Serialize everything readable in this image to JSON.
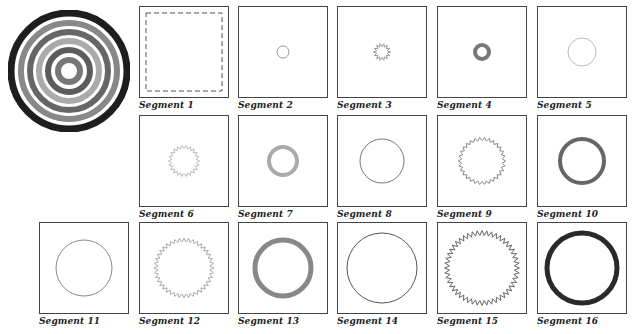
{
  "target": {
    "rings": [
      {
        "r": 58,
        "color": "#1e1e1e",
        "width": 7
      },
      {
        "r": 48,
        "color": "#888888",
        "width": 6
      },
      {
        "r": 39,
        "color": "#666666",
        "width": 6
      },
      {
        "r": 30,
        "color": "#aaaaaa",
        "width": 6
      },
      {
        "r": 21,
        "color": "#5c5c5c",
        "width": 6
      },
      {
        "r": 11,
        "color": "#777777",
        "width": 6
      }
    ]
  },
  "segments": [
    {
      "label": "Segment 1",
      "shape": "dashed-square",
      "r": 0,
      "color": "#555555",
      "width": 1
    },
    {
      "label": "Segment 2",
      "shape": "circle",
      "r": 6,
      "color": "#999999",
      "width": 1
    },
    {
      "label": "Segment 3",
      "shape": "zigzag",
      "r": 7,
      "color": "#999999",
      "width": 1,
      "teeth": 14
    },
    {
      "label": "Segment 4",
      "shape": "circle",
      "r": 7,
      "color": "#777777",
      "width": 4
    },
    {
      "label": "Segment 5",
      "shape": "circle",
      "r": 14,
      "color": "#bbbbbb",
      "width": 1
    },
    {
      "label": "Segment 6",
      "shape": "zigzag",
      "r": 14,
      "color": "#bbbbbb",
      "width": 1,
      "teeth": 22
    },
    {
      "label": "Segment 7",
      "shape": "circle",
      "r": 14,
      "color": "#aaaaaa",
      "width": 4
    },
    {
      "label": "Segment 8",
      "shape": "circle",
      "r": 22,
      "color": "#777777",
      "width": 1
    },
    {
      "label": "Segment 9",
      "shape": "zigzag",
      "r": 22,
      "color": "#888888",
      "width": 1,
      "teeth": 30
    },
    {
      "label": "Segment 10",
      "shape": "circle",
      "r": 22,
      "color": "#666666",
      "width": 4
    },
    {
      "label": "Segment 11",
      "shape": "circle",
      "r": 28,
      "color": "#888888",
      "width": 1
    },
    {
      "label": "Segment 12",
      "shape": "zigzag",
      "r": 28,
      "color": "#aaaaaa",
      "width": 1,
      "teeth": 40
    },
    {
      "label": "Segment 13",
      "shape": "circle",
      "r": 28,
      "color": "#888888",
      "width": 5
    },
    {
      "label": "Segment 14",
      "shape": "circle",
      "r": 35,
      "color": "#555555",
      "width": 1
    },
    {
      "label": "Segment 15",
      "shape": "zigzag",
      "r": 35,
      "color": "#666666",
      "width": 1,
      "teeth": 48
    },
    {
      "label": "Segment 16",
      "shape": "circle",
      "r": 35,
      "color": "#2a2a2a",
      "width": 5
    }
  ]
}
